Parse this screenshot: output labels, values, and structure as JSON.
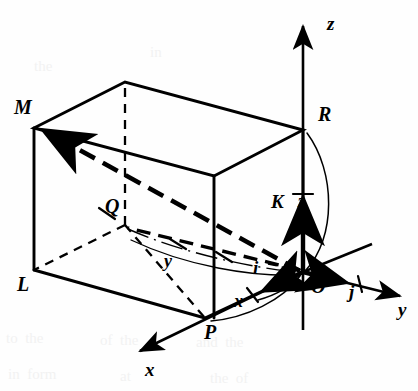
{
  "figure": {
    "kind": "3d-vector-diagram",
    "background_color": "#fefefe",
    "ink_color": "#000000",
    "bleed_color": "#f2f2f2"
  },
  "points": [
    {
      "id": "M",
      "label": "M",
      "x": 34,
      "y": 128,
      "label_x": 14,
      "label_y": 97,
      "kind": "vertex"
    },
    {
      "id": "R",
      "label": "R",
      "x": 303,
      "y": 130,
      "label_x": 318,
      "label_y": 104,
      "kind": "vertex"
    },
    {
      "id": "Q",
      "label": "Q",
      "x": 125,
      "y": 225,
      "label_x": 105,
      "label_y": 196,
      "kind": "vertex-hidden"
    },
    {
      "id": "L",
      "label": "L",
      "x": 34,
      "y": 270,
      "label_x": 17,
      "label_y": 274,
      "kind": "vertex"
    },
    {
      "id": "P",
      "label": "P",
      "x": 205,
      "y": 318,
      "label_x": 204,
      "label_y": 322,
      "kind": "vertex"
    },
    {
      "id": "O",
      "label": "O",
      "x": 303,
      "y": 272,
      "label_x": 311,
      "label_y": 276,
      "kind": "origin"
    }
  ],
  "axes": [
    {
      "id": "z",
      "label": "z",
      "label_x": 327,
      "label_y": 14,
      "tip_x": 303,
      "tip_y": 20,
      "direction": "up"
    },
    {
      "id": "y",
      "label": "y",
      "label_x": 398,
      "label_y": 300,
      "tip_x": 406,
      "tip_y": 297,
      "direction": "right-down"
    },
    {
      "id": "x",
      "label": "x",
      "label_x": 145,
      "label_y": 360,
      "tip_x": 134,
      "tip_y": 353,
      "direction": "left-down"
    }
  ],
  "unit_vectors": [
    {
      "id": "k",
      "label": "K",
      "label_x": 271,
      "label_y": 192,
      "axis": "z",
      "note": "unit vector along z, drawn upward from O"
    },
    {
      "id": "j",
      "label": "j",
      "label_x": 349,
      "label_y": 282,
      "axis": "y",
      "note": "unit vector along y, drawn from O toward y"
    },
    {
      "id": "i",
      "label": "i",
      "label_x": 253,
      "label_y": 258,
      "axis": "x",
      "note": "unit vector along x, drawn from O toward x"
    }
  ],
  "measure_labels": [
    {
      "id": "z-measure",
      "label": "z",
      "label_x": 298,
      "label_y": 192,
      "note": "z component measured along the vertical axis"
    },
    {
      "id": "y-measure",
      "label": "y",
      "label_x": 164,
      "label_y": 252,
      "note": "y component measured by the arc from Q to O"
    },
    {
      "id": "x-measure",
      "label": "x",
      "label_x": 234,
      "label_y": 292,
      "note": "x component measured by the arc from P to O"
    }
  ],
  "vector": {
    "id": "OM",
    "from": "O",
    "to": "M",
    "style": "thick-dashed-arrow",
    "note": "position vector from the origin O to the box corner M"
  },
  "bleed_text": [
    {
      "text": "to  the",
      "x": 6,
      "y": 330
    },
    {
      "text": "of  the",
      "x": 100,
      "y": 332
    },
    {
      "text": "and  the",
      "x": 196,
      "y": 334
    },
    {
      "text": "in  form",
      "x": 8,
      "y": 366
    },
    {
      "text": "at",
      "x": 120,
      "y": 368
    },
    {
      "text": "the  of",
      "x": 210,
      "y": 370
    },
    {
      "text": "the",
      "x": 34,
      "y": 58
    },
    {
      "text": "in",
      "x": 150,
      "y": 44
    }
  ]
}
